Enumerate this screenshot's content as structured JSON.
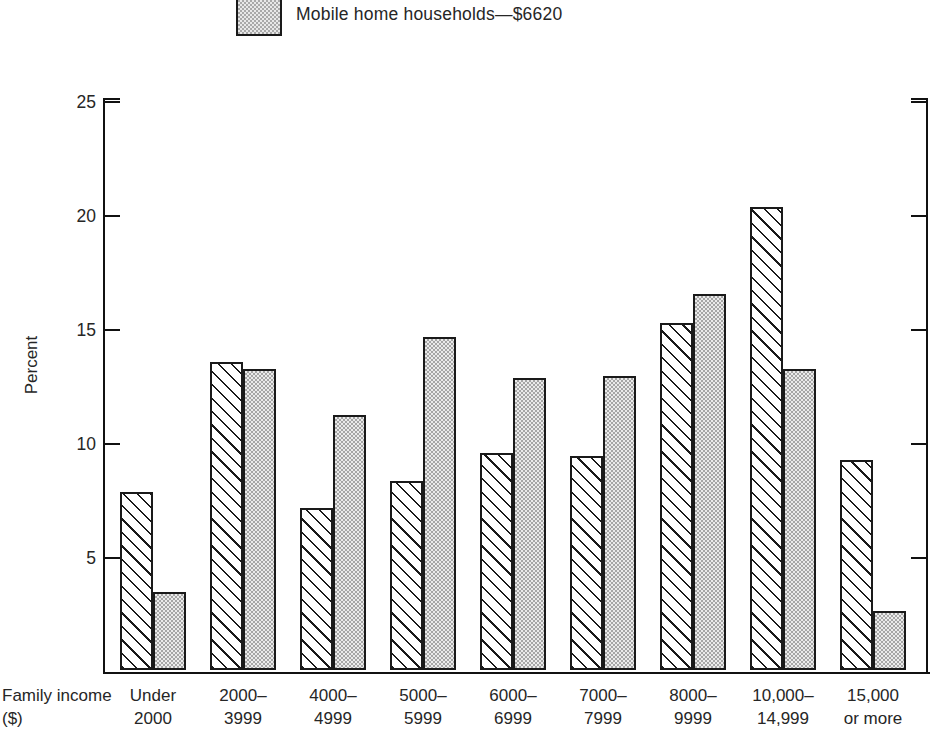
{
  "legend": {
    "swatch_name": "dotted-swatch",
    "label": "Mobile home households—$6620"
  },
  "axes": {
    "ylabel": "Percent",
    "xlabel_line1": "Family",
    "xlabel_line2": "income ($)",
    "yticks": [
      "25",
      "20",
      "15",
      "10",
      "5"
    ]
  },
  "chart_data": {
    "type": "bar",
    "title": "",
    "subtitle": "",
    "xlabel": "Family income ($)",
    "ylabel": "Percent",
    "ylim": [
      0,
      25
    ],
    "yticks": [
      5,
      10,
      15,
      20,
      25
    ],
    "grid": false,
    "legend_position": "top",
    "categories": [
      "Under 2000",
      "2000–3999",
      "4000–4999",
      "5000–5999",
      "6000–6999",
      "7000–7999",
      "8000–9999",
      "10,000–14,999",
      "15,000 or more"
    ],
    "category_lines": [
      [
        "Under",
        "2000"
      ],
      [
        "2000–",
        "3999"
      ],
      [
        "4000–",
        "4999"
      ],
      [
        "5000–",
        "5999"
      ],
      [
        "6000–",
        "6999"
      ],
      [
        "7000–",
        "7999"
      ],
      [
        "8000–",
        "9999"
      ],
      [
        "10,000–",
        "14,999"
      ],
      [
        "15,000",
        "or more"
      ]
    ],
    "series": [
      {
        "name": "All households",
        "pattern": "hatched",
        "values": [
          7.8,
          13.5,
          7.1,
          8.3,
          9.5,
          9.4,
          15.2,
          20.3,
          9.2
        ]
      },
      {
        "name": "Mobile home households—$6620",
        "pattern": "dotted",
        "values": [
          3.4,
          13.2,
          11.2,
          14.6,
          12.8,
          12.9,
          16.5,
          13.2,
          2.6
        ]
      }
    ]
  },
  "colors": {
    "ink": "#1a1a1a",
    "dotted_fill": "#ebebeb",
    "background": "#ffffff"
  }
}
